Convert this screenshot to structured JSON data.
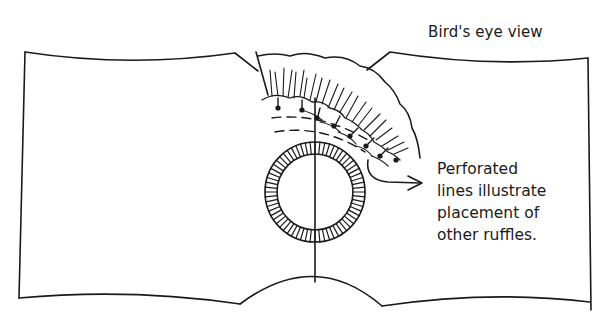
{
  "figure": {
    "title": "Bird's eye view",
    "annotation": {
      "lines": [
        "Perforated",
        "lines illustrate",
        "placement of",
        "other ruffles."
      ]
    },
    "elements": [
      "fabric-panel-outline",
      "ruffle",
      "dashed-placement-lines",
      "hatched-ring-opening",
      "center-line",
      "pointer-arrow"
    ],
    "colors": {
      "ink": "#1a1a1a",
      "background": "#ffffff"
    }
  }
}
